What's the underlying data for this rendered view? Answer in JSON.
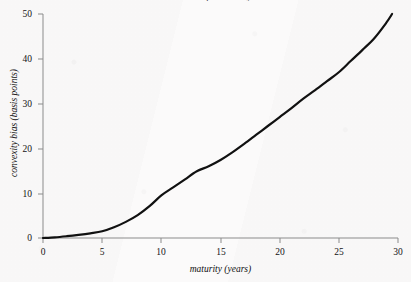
{
  "figure": {
    "clipped_title_fragment": "term structure of convexity bias",
    "background_color": "#fbfafa",
    "ink_color": "#111111",
    "axis_color": "#8b8b8b"
  },
  "chart_data": {
    "type": "line",
    "title": "",
    "xlabel": "maturity (years)",
    "ylabel": "convexity bias (basis points)",
    "xlim": [
      0,
      30
    ],
    "ylim": [
      0,
      50
    ],
    "xticks": [
      0,
      5,
      10,
      15,
      20,
      25,
      30
    ],
    "xticklabels": [
      "0",
      "5",
      "10",
      "15",
      "20",
      "25",
      "30"
    ],
    "yticks": [
      0,
      10,
      20,
      30,
      40,
      50
    ],
    "yticklabels": [
      "0",
      "10",
      "20",
      "30",
      "40",
      "50"
    ],
    "grid": false,
    "legend": null,
    "series": [
      {
        "name": "convexity bias",
        "color": "#111111",
        "linewidth": 2.2,
        "x": [
          0,
          1,
          2,
          3,
          4,
          5,
          6,
          7,
          8,
          9,
          10,
          11,
          12,
          13,
          14,
          15,
          16,
          17,
          18,
          19,
          20,
          21,
          22,
          23,
          24,
          25,
          26,
          27,
          28,
          29,
          29.5
        ],
        "y": [
          0.0,
          0.15,
          0.4,
          0.7,
          1.05,
          1.5,
          2.4,
          3.6,
          5.1,
          7.1,
          9.5,
          11.3,
          13.1,
          14.9,
          16.0,
          17.4,
          19.1,
          21.0,
          23.0,
          25.0,
          27.0,
          29.0,
          31.1,
          33.0,
          35.0,
          37.0,
          39.5,
          42.0,
          44.6,
          48.0,
          50.0
        ]
      }
    ]
  }
}
